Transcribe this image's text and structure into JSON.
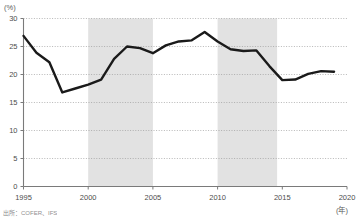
{
  "chart_data": {
    "type": "line",
    "title": "",
    "subtitle": "",
    "xlabel": "(年)",
    "ylabel": "(%)",
    "xlim": [
      1995,
      2020
    ],
    "ylim": [
      0,
      30
    ],
    "grid": "horizontal-dotted",
    "legend": "none",
    "yticks": [
      0,
      5,
      10,
      15,
      20,
      25,
      30
    ],
    "ytick_labels": [
      "0",
      "5",
      "10",
      "15",
      "20",
      "25",
      "30"
    ],
    "xticks": [
      1995,
      2000,
      2005,
      2010,
      2015,
      2020
    ],
    "xtick_labels": [
      "1995",
      "2000",
      "2005",
      "2010",
      "2015",
      "2020"
    ],
    "x": [
      1995,
      1996,
      1997,
      1998,
      1999,
      2000,
      2001,
      2002,
      2003,
      2004,
      2005,
      2006,
      2007,
      2008,
      2009,
      2010,
      2011,
      2012,
      2013,
      2014,
      2015,
      2016,
      2017,
      2018,
      2019
    ],
    "series": [
      {
        "name": "ratio",
        "color": "#1a1a1a",
        "line_width": 2.4,
        "values": [
          26.9,
          23.9,
          22.2,
          16.8,
          17.5,
          18.2,
          19.1,
          22.8,
          25.0,
          24.7,
          23.8,
          25.2,
          25.9,
          26.1,
          27.6,
          25.9,
          24.5,
          24.2,
          24.3,
          21.5,
          19.0,
          19.1,
          20.1,
          20.6,
          20.5
        ]
      }
    ],
    "shaded_bands": [
      {
        "name": "band-2000-2005",
        "from": 2000,
        "to": 2005,
        "color": "#e2e2e2"
      },
      {
        "name": "band-2010-2015",
        "from": 2010,
        "to": 2014.6,
        "color": "#e2e2e2"
      }
    ],
    "annotations": []
  },
  "footer": {
    "source": "出所：COFER、IFS"
  },
  "colors": {
    "line": "#1a1a1a",
    "band": "#e2e2e2",
    "grid": "#9a9a9a",
    "axis": "#7a7a7a",
    "text": "#4d4d4d"
  }
}
